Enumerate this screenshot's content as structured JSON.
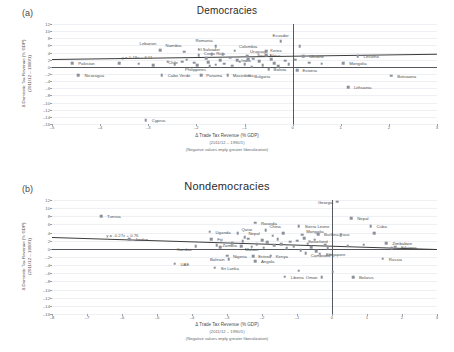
{
  "figure": {
    "panels": [
      {
        "letter": "(a)",
        "title": "Democracies",
        "equation": "y = 0.18x + 3.11",
        "xlabel": "Δ Trade Tax Revenue (% GDP)",
        "xlabel_sub1": "(2011/12 – 1990/1)",
        "xlabel_sub2": "(Negative values imply greater liberalization)",
        "ylabel_line1": "Δ Domestic Tax Revenue (% GDP)",
        "ylabel_line2": "(2011/12 – 1990/1)",
        "xlim": [
          -5,
          3
        ],
        "ylim": [
          -16,
          12
        ],
        "xticks": [
          -5,
          -4,
          -3,
          -2,
          -1,
          0,
          1,
          2,
          3
        ],
        "yticks": [
          12,
          10,
          8,
          6,
          4,
          2,
          0,
          -2,
          -4,
          -6,
          -8,
          -10,
          -12,
          -14,
          -16
        ]
      },
      {
        "letter": "(b)",
        "title": "Nondemocracies",
        "equation": "y = -0.27x + 0.76",
        "xlabel": "Δ Trade Tax Revenue (% GDP)",
        "xlabel_sub1": "(2011/12 – 1990/1)",
        "xlabel_sub2": "(Negative values imply greater liberalization)",
        "ylabel_line1": "Δ Domestic Tax Revenue (% GDP)",
        "ylabel_line2": "(2011/12 – 1990/1)",
        "xlim": [
          -8,
          3
        ],
        "ylim": [
          -16,
          12
        ],
        "xticks": [
          -8,
          -7,
          -6,
          -5,
          -4,
          -3,
          -2,
          -1,
          0,
          1,
          2,
          3
        ],
        "yticks": [
          12,
          10,
          8,
          6,
          4,
          2,
          0,
          -2,
          -4,
          -6,
          -8,
          -10,
          -12,
          -14,
          -16
        ]
      }
    ]
  },
  "chart_data": [
    {
      "type": "scatter",
      "title": "Democracies",
      "xlabel": "Δ Trade Tax Revenue (% GDP) (2011/12 – 1990/1)",
      "ylabel": "Δ Domestic Tax Revenue (% GDP) (2011/12 – 1990/1)",
      "xlim": [
        -5,
        3
      ],
      "ylim": [
        -16,
        12
      ],
      "grid": true,
      "legend": "none",
      "trendline": {
        "slope": 0.18,
        "intercept": 3.11,
        "label": "y = 0.18x + 3.11"
      },
      "points": [
        {
          "label": "Pakistan",
          "x": -4.58,
          "y": 1.0,
          "lx": 6,
          "ly": 0
        },
        {
          "label": "Nicaragua",
          "x": -4.45,
          "y": -2.3,
          "lx": 6,
          "ly": 0
        },
        {
          "label": "Cyprus",
          "x": -3.05,
          "y": -15.0,
          "lx": 6,
          "ly": 0
        },
        {
          "label": "Lebanon",
          "x": -2.75,
          "y": 4.6,
          "lx": -4,
          "ly": -7,
          "anchor": "end"
        },
        {
          "label": "Cabo Verde",
          "x": -2.72,
          "y": -2.3,
          "lx": 6,
          "ly": 0
        },
        {
          "label": "Chile",
          "x": -2.3,
          "y": 1.4,
          "lx": -4,
          "ly": 0,
          "anchor": "end"
        },
        {
          "label": "Namibia",
          "x": -2.25,
          "y": 4.2,
          "lx": -3,
          "ly": -7,
          "anchor": "end"
        },
        {
          "label": "Costa Rica",
          "x": -1.95,
          "y": 3.2,
          "lx": 5,
          "ly": -2
        },
        {
          "label": "Panama",
          "x": -1.9,
          "y": -2.4,
          "lx": 5,
          "ly": 0
        },
        {
          "label": "Philippines",
          "x": -1.72,
          "y": 0.2,
          "lx": -4,
          "ly": 3,
          "anchor": "end"
        },
        {
          "label": "Romania",
          "x": -1.6,
          "y": 5.8,
          "lx": -3,
          "ly": -6,
          "anchor": "end"
        },
        {
          "label": "El Salvador",
          "x": -1.45,
          "y": 3.5,
          "lx": -3,
          "ly": -5,
          "anchor": "end"
        },
        {
          "label": "Macedonia",
          "x": -1.35,
          "y": -2.4,
          "lx": 5,
          "ly": 0
        },
        {
          "label": "Colombia",
          "x": -1.2,
          "y": 4.5,
          "lx": 4,
          "ly": -5
        },
        {
          "label": "India",
          "x": -1.15,
          "y": 1.8,
          "lx": 4,
          "ly": 0
        },
        {
          "label": "Uruguay",
          "x": -0.95,
          "y": 3.1,
          "lx": 3,
          "ly": -5
        },
        {
          "label": "Bulgaria",
          "x": -0.9,
          "y": -2.5,
          "lx": 5,
          "ly": 0
        },
        {
          "label": "South Africa",
          "x": -0.82,
          "y": 2.3,
          "lx": 4,
          "ly": -4
        },
        {
          "label": "Korea",
          "x": -0.55,
          "y": 3.2,
          "lx": 4,
          "ly": -5
        },
        {
          "label": "Bolivia",
          "x": -0.5,
          "y": -0.6,
          "lx": 5,
          "ly": 0
        },
        {
          "label": "Ecuador",
          "x": -0.25,
          "y": 7.2,
          "lx": 0,
          "ly": -6,
          "anchor": "middle"
        },
        {
          "label": "Estonia",
          "x": 0.1,
          "y": -0.9,
          "lx": 5,
          "ly": 0
        },
        {
          "label": "Ukraine",
          "x": 0.22,
          "y": 3.0,
          "lx": 6,
          "ly": 0
        },
        {
          "label": "Mongolia",
          "x": 1.05,
          "y": 1.1,
          "lx": 6,
          "ly": 0
        },
        {
          "label": "Lesotho",
          "x": 1.35,
          "y": 3.0,
          "lx": 6,
          "ly": 0
        },
        {
          "label": "Lithuania",
          "x": 1.15,
          "y": -5.7,
          "lx": 6,
          "ly": 0
        },
        {
          "label": "Botswana",
          "x": 2.05,
          "y": -2.5,
          "lx": 6,
          "ly": 0
        },
        {
          "label": "",
          "x": -3.6,
          "y": 1.1
        },
        {
          "label": "",
          "x": -3.2,
          "y": 0.9
        },
        {
          "label": "",
          "x": -2.6,
          "y": 1.5
        },
        {
          "label": "",
          "x": -2.45,
          "y": 0.7
        },
        {
          "label": "",
          "x": -2.2,
          "y": 2.0
        },
        {
          "label": "",
          "x": -2.05,
          "y": 1.2
        },
        {
          "label": "",
          "x": -1.98,
          "y": 0.4
        },
        {
          "label": "",
          "x": -1.8,
          "y": 2.4
        },
        {
          "label": "",
          "x": -1.75,
          "y": 1.3
        },
        {
          "label": "",
          "x": -1.6,
          "y": 0.6
        },
        {
          "label": "",
          "x": -1.5,
          "y": 1.9
        },
        {
          "label": "",
          "x": -1.42,
          "y": 0.9
        },
        {
          "label": "",
          "x": -1.3,
          "y": 2.6
        },
        {
          "label": "",
          "x": -1.25,
          "y": 0.3
        },
        {
          "label": "",
          "x": -1.1,
          "y": 1.5
        },
        {
          "label": "",
          "x": -1.0,
          "y": 0.8
        },
        {
          "label": "",
          "x": -0.92,
          "y": 2.1
        },
        {
          "label": "",
          "x": -0.85,
          "y": 0.1
        },
        {
          "label": "",
          "x": -0.7,
          "y": 1.6
        },
        {
          "label": "",
          "x": -0.62,
          "y": 0.5
        },
        {
          "label": "",
          "x": -0.45,
          "y": 2.2
        },
        {
          "label": "",
          "x": -0.38,
          "y": 1.0
        },
        {
          "label": "",
          "x": -0.3,
          "y": 0.2
        },
        {
          "label": "",
          "x": -0.15,
          "y": 1.7
        },
        {
          "label": "",
          "x": -0.08,
          "y": 0.7
        },
        {
          "label": "",
          "x": 0.05,
          "y": 2.0
        },
        {
          "label": "",
          "x": 0.35,
          "y": 1.2
        },
        {
          "label": "",
          "x": 0.6,
          "y": 0.9
        },
        {
          "label": "",
          "x": -2.9,
          "y": 0.5
        },
        {
          "label": "",
          "x": -1.68,
          "y": 3.6
        },
        {
          "label": "",
          "x": -0.55,
          "y": 4.4
        },
        {
          "label": "",
          "x": 0.15,
          "y": 5.8
        }
      ]
    },
    {
      "type": "scatter",
      "title": "Nondemocracies",
      "xlabel": "Δ Trade Tax Revenue (% GDP) (2011/12 – 1990/1)",
      "ylabel": "Δ Domestic Tax Revenue (% GDP) (2011/12 – 1990/1)",
      "xlim": [
        -8,
        3
      ],
      "ylim": [
        -16,
        12
      ],
      "grid": true,
      "legend": "none",
      "trendline": {
        "slope": -0.27,
        "intercept": 0.76,
        "label": "y = -0.27x + 0.76"
      },
      "points": [
        {
          "label": "Tunisia",
          "x": -6.6,
          "y": 8.0,
          "lx": 6,
          "ly": 0
        },
        {
          "label": "Jordan",
          "x": -5.8,
          "y": 2.4,
          "lx": 6,
          "ly": 0
        },
        {
          "label": "UAE",
          "x": -4.5,
          "y": -3.6,
          "lx": 6,
          "ly": 0
        },
        {
          "label": "Gambia",
          "x": -3.9,
          "y": 0.6,
          "lx": -4,
          "ly": 3,
          "anchor": "end"
        },
        {
          "label": "Uganda",
          "x": -3.5,
          "y": 4.2,
          "lx": 6,
          "ly": 0
        },
        {
          "label": "Fiji",
          "x": -3.45,
          "y": 2.3,
          "lx": 6,
          "ly": 0
        },
        {
          "label": "Zambia",
          "x": -3.3,
          "y": 0.9,
          "lx": 6,
          "ly": 0
        },
        {
          "label": "Sri Lanka",
          "x": -3.35,
          "y": -4.6,
          "lx": 6,
          "ly": 0
        },
        {
          "label": "Nigeria",
          "x": -3.0,
          "y": -1.7,
          "lx": 6,
          "ly": 0
        },
        {
          "label": "Bahrain",
          "x": -2.95,
          "y": -2.6,
          "lx": -4,
          "ly": 0,
          "anchor": "end"
        },
        {
          "label": "Qatar",
          "x": -2.7,
          "y": 3.9,
          "lx": 4,
          "ly": -4
        },
        {
          "label": "Nepal",
          "x": -2.5,
          "y": 2.9,
          "lx": 4,
          "ly": -4
        },
        {
          "label": "Malawi",
          "x": -2.6,
          "y": 0.7,
          "lx": 4,
          "ly": 3
        },
        {
          "label": "Eritrea",
          "x": -2.25,
          "y": -1.8,
          "lx": 5,
          "ly": 0
        },
        {
          "label": "Angola",
          "x": -2.2,
          "y": -3.1,
          "lx": 6,
          "ly": 0
        },
        {
          "label": "Rwanda",
          "x": -2.2,
          "y": 6.4,
          "lx": 6,
          "ly": 0
        },
        {
          "label": "China",
          "x": -1.9,
          "y": 4.6,
          "lx": 4,
          "ly": -4
        },
        {
          "label": "Kenya",
          "x": -1.75,
          "y": -1.7,
          "lx": 5,
          "ly": 0
        },
        {
          "label": "Liberia",
          "x": -1.35,
          "y": -6.8,
          "lx": 6,
          "ly": 0
        },
        {
          "label": "Sierra Leone",
          "x": -0.95,
          "y": 5.6,
          "lx": 6,
          "ly": 0
        },
        {
          "label": "Mongolia",
          "x": -0.85,
          "y": 3.5,
          "lx": 4,
          "ly": -4
        },
        {
          "label": "Swaziland",
          "x": -0.8,
          "y": 2.6,
          "lx": 4,
          "ly": 3
        },
        {
          "label": "Cambodia",
          "x": -0.75,
          "y": -1.1,
          "lx": 5,
          "ly": 2
        },
        {
          "label": "Burkina Faso",
          "x": -0.4,
          "y": 3.6,
          "lx": 6,
          "ly": 0
        },
        {
          "label": "Singapore",
          "x": -0.35,
          "y": -1.2,
          "lx": 6,
          "ly": 0
        },
        {
          "label": "Oman",
          "x": -0.3,
          "y": -7.0,
          "lx": -4,
          "ly": 0,
          "anchor": "end"
        },
        {
          "label": "Georgia",
          "x": 0.15,
          "y": 11.6,
          "lx": -4,
          "ly": 0,
          "anchor": "end"
        },
        {
          "label": "Nepal",
          "x": 0.55,
          "y": 7.6,
          "lx": 6,
          "ly": 0
        },
        {
          "label": "Belarus",
          "x": 0.6,
          "y": -7.0,
          "lx": 6,
          "ly": 0
        },
        {
          "label": "Cuba",
          "x": 1.1,
          "y": 5.6,
          "lx": 6,
          "ly": 0
        },
        {
          "label": "Russia",
          "x": 1.45,
          "y": -2.4,
          "lx": 6,
          "ly": 0
        },
        {
          "label": "Zimbabwe",
          "x": 1.55,
          "y": 1.4,
          "lx": 6,
          "ly": 0
        },
        {
          "label": "Ethiopia",
          "x": 1.8,
          "y": 0.5,
          "lx": 6,
          "ly": 0
        },
        {
          "label": "",
          "x": -3.2,
          "y": 0.4
        },
        {
          "label": "",
          "x": -2.85,
          "y": 1.4
        },
        {
          "label": "",
          "x": -2.55,
          "y": 1.9
        },
        {
          "label": "",
          "x": -2.4,
          "y": 2.5
        },
        {
          "label": "",
          "x": -2.3,
          "y": 0.5
        },
        {
          "label": "",
          "x": -2.15,
          "y": 1.2
        },
        {
          "label": "",
          "x": -2.0,
          "y": 2.1
        },
        {
          "label": "",
          "x": -1.95,
          "y": 0.3
        },
        {
          "label": "",
          "x": -1.85,
          "y": 1.6
        },
        {
          "label": "",
          "x": -1.7,
          "y": 3.2
        },
        {
          "label": "",
          "x": -1.65,
          "y": 0.9
        },
        {
          "label": "",
          "x": -1.55,
          "y": 2.3
        },
        {
          "label": "",
          "x": -1.45,
          "y": 1.1
        },
        {
          "label": "",
          "x": -1.4,
          "y": 3.9
        },
        {
          "label": "",
          "x": -1.3,
          "y": 0.2
        },
        {
          "label": "",
          "x": -1.2,
          "y": 1.8
        },
        {
          "label": "",
          "x": -1.1,
          "y": 0.6
        },
        {
          "label": "",
          "x": -1.0,
          "y": 2.0
        },
        {
          "label": "",
          "x": -0.9,
          "y": -0.3
        },
        {
          "label": "",
          "x": -0.7,
          "y": 1.3
        },
        {
          "label": "",
          "x": -0.6,
          "y": 0.4
        },
        {
          "label": "",
          "x": -0.5,
          "y": 2.2
        },
        {
          "label": "",
          "x": -0.45,
          "y": -0.6
        },
        {
          "label": "",
          "x": -0.2,
          "y": 1.0
        },
        {
          "label": "",
          "x": -0.12,
          "y": 0.1
        },
        {
          "label": "",
          "x": -0.05,
          "y": -1.4
        },
        {
          "label": "",
          "x": 0.02,
          "y": -5.6
        },
        {
          "label": "",
          "x": -0.95,
          "y": -5.4
        },
        {
          "label": "",
          "x": 0.25,
          "y": 3.4
        },
        {
          "label": "",
          "x": 0.45,
          "y": 0.8
        },
        {
          "label": "",
          "x": 0.9,
          "y": 1.0
        },
        {
          "label": "",
          "x": 1.2,
          "y": 3.8
        },
        {
          "label": "",
          "x": 1.7,
          "y": 0.2
        }
      ]
    }
  ]
}
